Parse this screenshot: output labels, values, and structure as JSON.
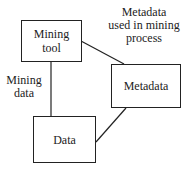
{
  "diagram": {
    "nodes": [
      {
        "id": "mining-tool",
        "label_line1": "Mining",
        "label_line2": "tool"
      },
      {
        "id": "metadata",
        "label": "Metadata"
      },
      {
        "id": "data",
        "label": "Data"
      }
    ],
    "edges": [
      {
        "from": "mining-tool",
        "to": "data",
        "label_line1": "Mining",
        "label_line2": "data"
      },
      {
        "from": "mining-tool",
        "to": "metadata",
        "label_line1": "Metadata",
        "label_line2": "used in mining",
        "label_line3": "process"
      },
      {
        "from": "metadata",
        "to": "data",
        "label": ""
      }
    ]
  }
}
